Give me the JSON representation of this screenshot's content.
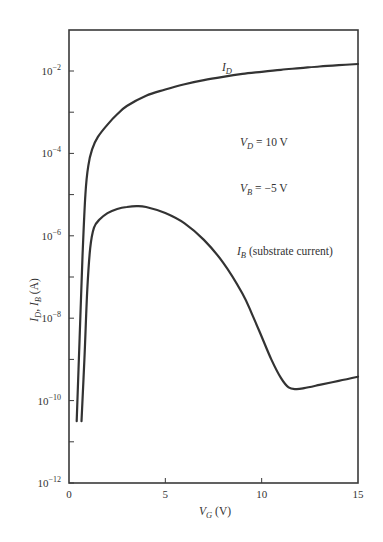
{
  "chart_data": {
    "type": "line",
    "title": "",
    "xlabel": "V_G (V)",
    "ylabel": "I_D, I_B (A)",
    "xscale": "linear",
    "yscale": "log",
    "xlim": [
      0,
      15
    ],
    "ylim": [
      1e-12,
      0.1
    ],
    "xticks": [
      0,
      5,
      10,
      15
    ],
    "xtick_labels": [
      "0",
      "5",
      "10",
      "15"
    ],
    "yticks_major": [
      -2,
      -4,
      -6,
      -8,
      -10,
      -12
    ],
    "ytick_labels": [
      {
        "exp": -2,
        "base": "10",
        "sup": "−2"
      },
      {
        "exp": -4,
        "base": "10",
        "sup": "−4"
      },
      {
        "exp": -6,
        "base": "10",
        "sup": "−6"
      },
      {
        "exp": -8,
        "base": "10",
        "sup": "−8"
      },
      {
        "exp": -10,
        "base": "10",
        "sup": "−10"
      },
      {
        "exp": -12,
        "base": "10",
        "sup": "−12"
      }
    ],
    "yticks_minor": [
      -3,
      -5,
      -7,
      -9,
      -11
    ],
    "grid": false,
    "legend": null,
    "series": [
      {
        "name": "I_D",
        "label_main": "I",
        "label_sub": "D",
        "x": [
          0.4,
          0.55,
          0.7,
          0.85,
          1.0,
          1.2,
          1.5,
          2.0,
          2.5,
          3.0,
          4.0,
          5.0,
          6.0,
          7.0,
          8.0,
          9.0,
          10.0,
          11.0,
          12.0,
          13.0,
          14.0,
          15.0
        ],
        "log10y": [
          -10.5,
          -8.5,
          -6.5,
          -5.0,
          -4.3,
          -3.9,
          -3.6,
          -3.3,
          -3.05,
          -2.85,
          -2.6,
          -2.45,
          -2.32,
          -2.22,
          -2.14,
          -2.07,
          -2.02,
          -1.97,
          -1.93,
          -1.89,
          -1.86,
          -1.83
        ]
      },
      {
        "name": "I_B (substrate current)",
        "label_main": "I",
        "label_sub": "B",
        "label_rest": " (substrate current)",
        "x": [
          0.65,
          0.8,
          0.95,
          1.1,
          1.3,
          1.6,
          2.0,
          2.5,
          3.0,
          3.5,
          4.0,
          5.0,
          6.0,
          7.0,
          8.0,
          9.0,
          9.5,
          10.0,
          10.5,
          11.0,
          11.4,
          11.8,
          12.2,
          13.0,
          14.0,
          15.0
        ],
        "log10y": [
          -10.5,
          -9.0,
          -7.3,
          -6.3,
          -5.8,
          -5.6,
          -5.45,
          -5.35,
          -5.3,
          -5.28,
          -5.3,
          -5.45,
          -5.7,
          -6.1,
          -6.65,
          -7.4,
          -7.9,
          -8.45,
          -9.0,
          -9.45,
          -9.68,
          -9.72,
          -9.7,
          -9.62,
          -9.52,
          -9.42
        ]
      }
    ],
    "annotations": [
      {
        "text_main": "V",
        "text_sub": "D",
        "text_rest": " = 10 V",
        "x_px": 240,
        "y_px": 146
      },
      {
        "text_main": "V",
        "text_sub": "B",
        "text_rest": " = −5 V",
        "x_px": 240,
        "y_px": 192
      },
      {
        "text_main": "I",
        "text_sub": "D",
        "text_rest": "",
        "x_px": 222,
        "y_px": 71
      },
      {
        "text_main": "I",
        "text_sub": "B",
        "text_rest": " (substrate current)",
        "x_px": 237,
        "y_px": 255
      }
    ],
    "axis_title_x": {
      "main": "V",
      "sub": "G",
      "rest": " (V)"
    },
    "axis_title_y": {
      "main1": "I",
      "sub1": "D",
      "sep": ", ",
      "main2": "I",
      "sub2": "B",
      "rest": " (A)"
    }
  }
}
